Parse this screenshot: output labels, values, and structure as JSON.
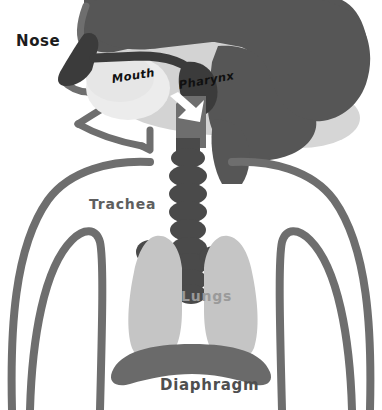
{
  "diagram": {
    "view": "side profile of head and upper torso",
    "background_color": "#ffffff"
  },
  "labels": {
    "nose": "Nose",
    "mouth": "Mouth",
    "pharynx": "Pharynx",
    "trachea": "Trachea",
    "lungs": "Lungs",
    "diaphragm": "Diaphragm"
  },
  "label_styles": {
    "nose": {
      "color": "#1c1c1c",
      "weight": "bold",
      "style": "upright"
    },
    "mouth": {
      "color": "#101010",
      "weight": "bold",
      "style": "italic"
    },
    "pharynx": {
      "color": "#101010",
      "weight": "bold",
      "style": "italic"
    },
    "trachea": {
      "color": "#5e5e5e",
      "weight": "normal",
      "style": "upright"
    },
    "lungs": {
      "color": "#9a9a9a",
      "weight": "normal",
      "style": "upright"
    },
    "diaphragm": {
      "color": "#4f4f4f",
      "weight": "normal",
      "style": "upright"
    }
  },
  "palette": {
    "head_silhouette": "#565656",
    "head_shadow": "#d3d3d3",
    "body_outline": "#6e6e6e",
    "nasal_passage": "#3b3b3b",
    "airway_dark": "#4a4a4a",
    "trachea_rings": "#4a4a4a",
    "bronchi": "#4a4a4a",
    "lung_fill": "#c5c5c5",
    "oral_cavity": "#ececec",
    "diaphragm": "#6a6a6a",
    "arrow": "#ffffff",
    "background": "#ffffff"
  },
  "parts": [
    {
      "name": "nose",
      "label": "Nose",
      "color": "#3b3b3b",
      "description": "dark nasal passage at front of face"
    },
    {
      "name": "mouth",
      "label": "Mouth",
      "color": "#ececec",
      "description": "light oral cavity behind the jaw"
    },
    {
      "name": "pharynx",
      "label": "Pharynx",
      "color": "#4a4a4a",
      "description": "shared passage joining nose and mouth to trachea, marked by a white downward arrow"
    },
    {
      "name": "trachea",
      "label": "Trachea",
      "color": "#4a4a4a",
      "description": "segmented ringed windpipe descending from pharynx"
    },
    {
      "name": "lungs",
      "label": "Lungs",
      "color": "#c5c5c5",
      "description": "pair of light gray lobes flanking the bronchi"
    },
    {
      "name": "diaphragm",
      "label": "Diaphragm",
      "color": "#6a6a6a",
      "description": "thick curved muscle band below the lungs"
    }
  ],
  "annotations": {
    "airflow_arrow": "white downward arrow in the pharynx indicating direction of airflow"
  }
}
